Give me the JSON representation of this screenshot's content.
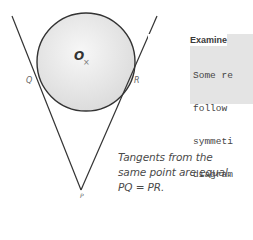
{
  "diagram": {
    "labels": {
      "center": "O",
      "center_mark": "×",
      "left_tangent_point": "Q",
      "right_tangent_point": "R",
      "external_point": "P"
    },
    "colors": {
      "circle_fill": "#e9e9e9",
      "stroke": "#333333"
    }
  },
  "examiner": {
    "title": "Examine",
    "lines": [
      "Some re",
      "follow",
      "symmeti",
      "diagram"
    ]
  },
  "caption": {
    "lines": [
      "Tangents from the",
      "same point are equal.",
      "PQ = PR."
    ]
  }
}
